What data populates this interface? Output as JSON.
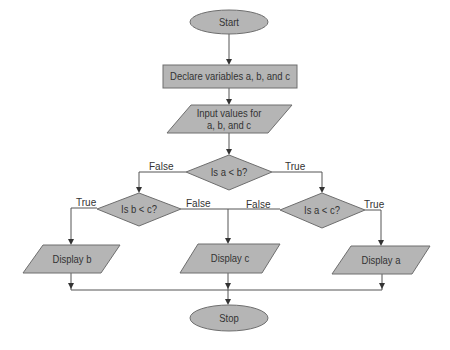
{
  "diagram": {
    "type": "flowchart",
    "colors": {
      "shape_fill": "#b5b5b5",
      "shape_stroke": "#6e6e6e",
      "line": "#555555",
      "text": "#333333"
    },
    "nodes": {
      "start": {
        "shape": "ellipse",
        "label": "Start"
      },
      "declare": {
        "shape": "rectangle",
        "label": "Declare variables a, b, and c"
      },
      "input": {
        "shape": "parallelogram",
        "label_line1": "Input values for",
        "label_line2": "a, b, and c"
      },
      "cond_ab": {
        "shape": "diamond",
        "label": "Is a < b?"
      },
      "cond_bc": {
        "shape": "diamond",
        "label": "Is b < c?"
      },
      "cond_ac": {
        "shape": "diamond",
        "label": "Is a < c?"
      },
      "display_b": {
        "shape": "parallelogram",
        "label": "Display b"
      },
      "display_c": {
        "shape": "parallelogram",
        "label": "Display c"
      },
      "display_a": {
        "shape": "parallelogram",
        "label": "Display a"
      },
      "stop": {
        "shape": "ellipse",
        "label": "Stop"
      }
    },
    "edge_labels": {
      "ab_false": "False",
      "ab_true": "True",
      "bc_true": "True",
      "bc_false": "False",
      "ac_false": "False",
      "ac_true": "True"
    },
    "edges": [
      [
        "start",
        "declare"
      ],
      [
        "declare",
        "input"
      ],
      [
        "input",
        "cond_ab"
      ],
      [
        "cond_ab",
        "cond_bc",
        "False"
      ],
      [
        "cond_ab",
        "cond_ac",
        "True"
      ],
      [
        "cond_bc",
        "display_b",
        "True"
      ],
      [
        "cond_bc",
        "display_c",
        "False"
      ],
      [
        "cond_ac",
        "display_c",
        "False"
      ],
      [
        "cond_ac",
        "display_a",
        "True"
      ],
      [
        "display_b",
        "stop"
      ],
      [
        "display_c",
        "stop"
      ],
      [
        "display_a",
        "stop"
      ]
    ]
  }
}
